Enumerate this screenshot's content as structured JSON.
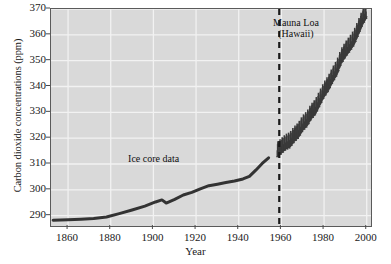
{
  "chart_data": {
    "type": "line",
    "title": "",
    "xlabel": "Year",
    "ylabel": "Carbon dioxide concentrations (ppm)",
    "xlim": [
      1852,
      2002
    ],
    "ylim": [
      286,
      370
    ],
    "grid": true,
    "legend_position": "none",
    "xticks": [
      1860,
      1880,
      1900,
      1920,
      1940,
      1960,
      1980,
      2000
    ],
    "yticks": [
      290,
      300,
      310,
      320,
      330,
      340,
      350,
      360,
      370
    ],
    "annotations": [
      {
        "name": "ice-core-label",
        "text": "Ice core data",
        "x": 1905,
        "y": 311
      },
      {
        "name": "mauna-loa-label",
        "line1": "Mauna Loa",
        "line2": "(Hawaii)",
        "x": 1972,
        "y": 364
      }
    ],
    "divider": {
      "name": "era-divider",
      "x": 1959,
      "style": "dashed",
      "color": "#1a1a1a"
    },
    "series": [
      {
        "name": "Ice core data",
        "type": "line",
        "color": "#333333",
        "width": 3,
        "points": [
          [
            1853,
            288.2
          ],
          [
            1860,
            288.4
          ],
          [
            1866,
            288.6
          ],
          [
            1872,
            288.9
          ],
          [
            1878,
            289.5
          ],
          [
            1884,
            290.8
          ],
          [
            1890,
            292.2
          ],
          [
            1896,
            293.7
          ],
          [
            1901,
            295.3
          ],
          [
            1904,
            296.1
          ],
          [
            1906,
            294.9
          ],
          [
            1910,
            296.3
          ],
          [
            1914,
            298.0
          ],
          [
            1918,
            299.0
          ],
          [
            1922,
            300.4
          ],
          [
            1926,
            301.6
          ],
          [
            1930,
            302.2
          ],
          [
            1934,
            302.8
          ],
          [
            1938,
            303.4
          ],
          [
            1942,
            304.2
          ],
          [
            1945,
            305.2
          ],
          [
            1948,
            307.6
          ],
          [
            1951,
            310.2
          ],
          [
            1954,
            312.4
          ]
        ]
      },
      {
        "name": "Mauna Loa (Hawaii)",
        "type": "sawtooth",
        "color": "#3a3a3a",
        "width": 1.6,
        "description": "Annual Keeling-curve oscillation with rising trend",
        "trend": [
          [
            1958,
            315.3
          ],
          [
            1960,
            316.9
          ],
          [
            1962,
            318.4
          ],
          [
            1964,
            319.2
          ],
          [
            1966,
            321.4
          ],
          [
            1968,
            323.0
          ],
          [
            1970,
            325.7
          ],
          [
            1972,
            327.4
          ],
          [
            1974,
            330.2
          ],
          [
            1976,
            332.1
          ],
          [
            1978,
            335.4
          ],
          [
            1980,
            338.7
          ],
          [
            1982,
            341.1
          ],
          [
            1984,
            344.4
          ],
          [
            1986,
            347.2
          ],
          [
            1988,
            351.5
          ],
          [
            1990,
            354.2
          ],
          [
            1992,
            356.4
          ],
          [
            1994,
            358.8
          ],
          [
            1996,
            362.6
          ],
          [
            1998,
            366.6
          ],
          [
            2000,
            369.5
          ]
        ],
        "seasonal_amplitude": 3.2
      }
    ]
  }
}
